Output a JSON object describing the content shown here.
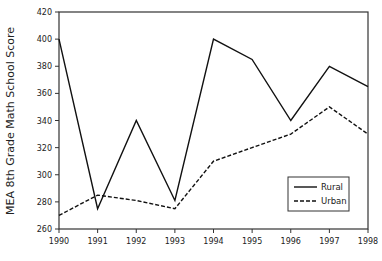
{
  "chart_data": {
    "type": "line",
    "title": "",
    "xlabel": "",
    "ylabel": "MEA 8th Grade Math School Score",
    "x": [
      1990,
      1991,
      1992,
      1993,
      1994,
      1995,
      1996,
      1997,
      1998
    ],
    "ylim": [
      260,
      420
    ],
    "yticks": [
      260,
      280,
      300,
      320,
      340,
      360,
      380,
      400,
      420
    ],
    "grid": false,
    "legend_position": "lower right",
    "series": [
      {
        "name": "Rural",
        "style": "solid",
        "color": "#111111",
        "values": [
          400,
          275,
          340,
          281,
          400,
          385,
          340,
          380,
          365
        ]
      },
      {
        "name": "Urban",
        "style": "dashed",
        "color": "#111111",
        "values": [
          270,
          285,
          281,
          275,
          310,
          320,
          330,
          350,
          330
        ]
      }
    ]
  }
}
